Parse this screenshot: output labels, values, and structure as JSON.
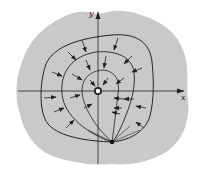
{
  "diagram": {
    "axes": {
      "x_label": "x",
      "y_label": "y"
    },
    "colors": {
      "region_fill": "#c9c9c9",
      "stroke": "#222222",
      "source_fill": "#ffffff",
      "sink_fill": "#111111"
    },
    "elements": {
      "region": "shaded region",
      "source": "open circle at origin",
      "sink": "filled dot below origin",
      "level_curves": 3,
      "arrows": "flow arrows pointing inward toward curves/sink"
    }
  }
}
